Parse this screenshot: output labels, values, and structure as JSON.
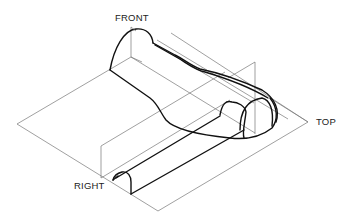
{
  "diagram": {
    "type": "isometric-orthographic-projection",
    "labels": {
      "front": "FRONT",
      "top": "TOP",
      "right": "RIGHT"
    },
    "colors": {
      "background": "#ffffff",
      "plane_lines": "#777777",
      "object_outline": "#111111",
      "text": "#222222"
    }
  }
}
